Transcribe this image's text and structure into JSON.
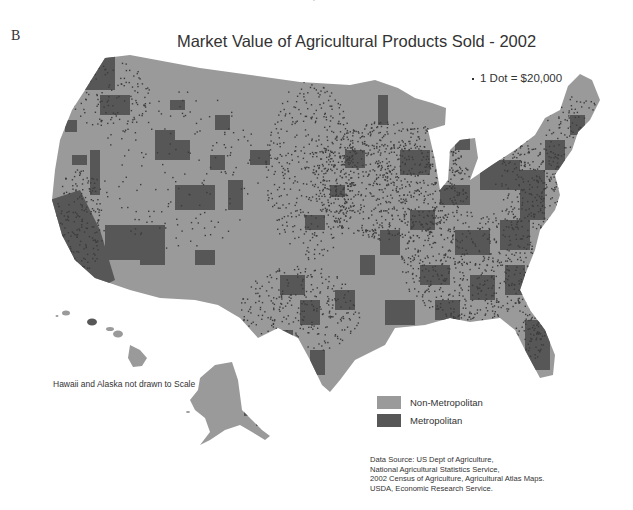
{
  "header": {
    "clipped_credit": "USDA, Economic Research Service.",
    "panel_letter": "B",
    "title": "Market Value of Agricultural Products Sold - 2002"
  },
  "dot_legend": {
    "icon": "dot-symbol-icon",
    "label": "1 Dot = $20,000"
  },
  "note": "Hawaii and Alaska not drawn to Scale",
  "legend": {
    "items": [
      {
        "label": "Non-Metropolitan",
        "color": "#9a9a9a"
      },
      {
        "label": "Metropolitan",
        "color": "#575757"
      }
    ]
  },
  "source": {
    "lines": [
      "Data Source: US Dept of Agriculture,",
      "National Agricultural Statistics Service,",
      "2002 Census of Agriculture, Agricultural Atlas Maps.",
      "USDA, Economic Research Service."
    ]
  },
  "colors": {
    "non_metro": "#9a9a9a",
    "metro": "#575757",
    "dot": "#3c3c3c",
    "water": "#ffffff"
  },
  "map": {
    "regions": [
      "Contiguous United States",
      "Hawaii",
      "Alaska"
    ],
    "dot_density_zones": [
      {
        "name": "Corn Belt / Midwest",
        "cx": 390,
        "cy": 180,
        "rx": 80,
        "ry": 60,
        "count": 900
      },
      {
        "name": "Great Plains",
        "cx": 310,
        "cy": 170,
        "rx": 45,
        "ry": 90,
        "count": 420
      },
      {
        "name": "Southeast",
        "cx": 470,
        "cy": 265,
        "rx": 70,
        "ry": 55,
        "count": 550
      },
      {
        "name": "Mid-Atlantic",
        "cx": 530,
        "cy": 185,
        "rx": 35,
        "ry": 45,
        "count": 260
      },
      {
        "name": "California Central Valley",
        "cx": 80,
        "cy": 220,
        "rx": 25,
        "ry": 55,
        "count": 200
      },
      {
        "name": "Pacific Northwest",
        "cx": 110,
        "cy": 95,
        "rx": 40,
        "ry": 35,
        "count": 130
      },
      {
        "name": "Texas",
        "cx": 300,
        "cy": 310,
        "rx": 60,
        "ry": 45,
        "count": 300
      },
      {
        "name": "Mountain West (sparse)",
        "cx": 180,
        "cy": 170,
        "rx": 80,
        "ry": 80,
        "count": 160
      },
      {
        "name": "Florida",
        "cx": 530,
        "cy": 330,
        "rx": 15,
        "ry": 30,
        "count": 90
      },
      {
        "name": "Northeast",
        "cx": 575,
        "cy": 130,
        "rx": 30,
        "ry": 35,
        "count": 120
      }
    ]
  }
}
